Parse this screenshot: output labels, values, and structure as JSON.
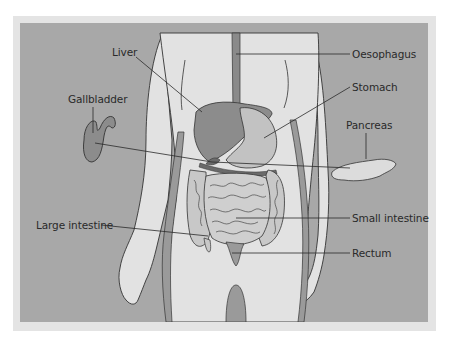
{
  "diagram": {
    "type": "anatomical-labelled-illustration",
    "colors": {
      "background_panel": "#a8a8a8",
      "frame": "#e4e4e4",
      "body": "#e2e2e2",
      "organ_dark": "#8a8a8a",
      "organ_mid": "#bdbdbd",
      "outline": "#333333"
    },
    "labels": {
      "liver": "Liver",
      "gallbladder": "Gallbladder",
      "oesophagus": "Oesophagus",
      "stomach": "Stomach",
      "pancreas": "Pancreas",
      "large_intestine": "Large intestine",
      "small_intestine": "Small intestine",
      "rectum": "Rectum"
    }
  }
}
